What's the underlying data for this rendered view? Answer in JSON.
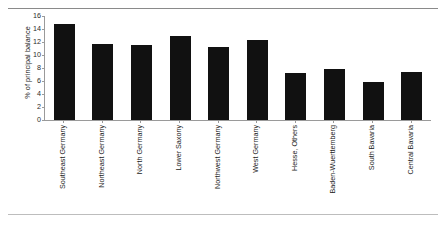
{
  "chart_data": {
    "type": "bar",
    "title": "",
    "xlabel": "",
    "ylabel": "% of principal balance",
    "ylim": [
      0,
      16
    ],
    "yticks": [
      0,
      2,
      4,
      6,
      8,
      10,
      12,
      14,
      16
    ],
    "grid": false,
    "legend": null,
    "bar_color": "#111111",
    "categories": [
      "Southeast Germany",
      "Northeast Germany",
      "North Germany",
      "Lower Saxony",
      "Northwest Germany",
      "West Germany",
      "Hesse, Others",
      "Baden-Wuerttemberg",
      "South Bavaria",
      "Central Bavaria"
    ],
    "values": [
      14.7,
      11.7,
      11.6,
      13.0,
      11.2,
      12.3,
      7.3,
      7.9,
      5.8,
      7.4
    ]
  }
}
